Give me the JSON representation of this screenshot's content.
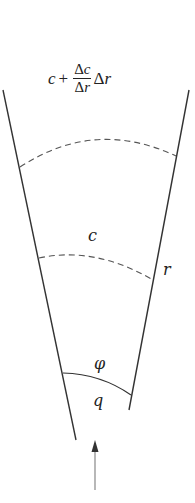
{
  "diagram": {
    "formula": {
      "c": "c",
      "plus": "+",
      "num_delta": "Δ",
      "num_var": "c",
      "den_delta": "Δ",
      "den_var": "r",
      "tail_delta": "Δ",
      "tail_var": "r"
    },
    "labels": {
      "c": "c",
      "r": "r",
      "phi": "φ",
      "q": "q"
    },
    "colors": {
      "line": "#333333",
      "dashed": "#555555",
      "arrow": "#888888"
    }
  }
}
